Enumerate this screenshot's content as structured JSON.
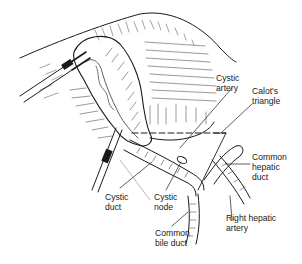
{
  "figure": {
    "type": "anatomical-illustration",
    "colors": {
      "ink": "#1a1a1a",
      "background": "#ffffff",
      "pointer_gray": "#9a9a9a"
    }
  },
  "labels": {
    "cystic_artery": {
      "line1": "Cystic",
      "line2": "artery"
    },
    "calots_triangle": {
      "line1": "Calot's",
      "line2": "triangle"
    },
    "common_hepatic_duct": {
      "line1": "Common",
      "line2": "hepatic",
      "line3": "duct"
    },
    "right_hepatic_artery": {
      "line1": "Right hepatic",
      "line2": "artery"
    },
    "cystic_duct": {
      "line1": "Cystic",
      "line2": "duct"
    },
    "cystic_node": {
      "line1": "Cystic",
      "line2": "node"
    },
    "common_bile_duct": {
      "line1": "Common",
      "line2": "bile duct"
    }
  }
}
